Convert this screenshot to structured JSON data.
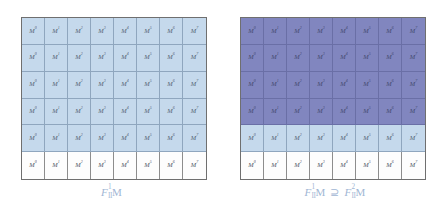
{
  "figure": {
    "colors": {
      "white_cell": "#fdfdfd",
      "light_blue_cell": "#c5d9ec",
      "dark_blue_cell": "#8186bf",
      "outer_border": "#6f6f6f",
      "inner_gridline": "#7b8ca3",
      "caption_text": "#9fb6d4",
      "cell_label_text": "#34404f"
    },
    "grid_size": {
      "columns": 8,
      "rows": 6
    }
  },
  "panels": [
    {
      "id": "left",
      "caption": {
        "f_letter": "F",
        "superscript": "1",
        "subscript": "II",
        "module_letter": "M",
        "relation": "",
        "second_f_letter": "",
        "second_superscript": "",
        "second_subscript": "",
        "second_module_letter": "",
        "full_text": "F¹₁₁M"
      },
      "row_tones": [
        "light",
        "light",
        "light",
        "light",
        "light",
        "white"
      ],
      "rows": [
        {
          "tone": "light",
          "cells": [
            {
              "base": "M",
              "sup": "0"
            },
            {
              "base": "M",
              "sup": "1"
            },
            {
              "base": "M",
              "sup": "2"
            },
            {
              "base": "M",
              "sup": "3"
            },
            {
              "base": "M",
              "sup": "4"
            },
            {
              "base": "M",
              "sup": "5"
            },
            {
              "base": "M",
              "sup": "6"
            },
            {
              "base": "M",
              "sup": "7"
            }
          ]
        },
        {
          "tone": "light",
          "cells": [
            {
              "base": "M",
              "sup": "0"
            },
            {
              "base": "M",
              "sup": "1"
            },
            {
              "base": "M",
              "sup": "2"
            },
            {
              "base": "M",
              "sup": "3"
            },
            {
              "base": "M",
              "sup": "4"
            },
            {
              "base": "M",
              "sup": "5"
            },
            {
              "base": "M",
              "sup": "6"
            },
            {
              "base": "M",
              "sup": "7"
            }
          ]
        },
        {
          "tone": "light",
          "cells": [
            {
              "base": "M",
              "sup": "0"
            },
            {
              "base": "M",
              "sup": "1"
            },
            {
              "base": "M",
              "sup": "2"
            },
            {
              "base": "M",
              "sup": "3"
            },
            {
              "base": "M",
              "sup": "4"
            },
            {
              "base": "M",
              "sup": "5"
            },
            {
              "base": "M",
              "sup": "6"
            },
            {
              "base": "M",
              "sup": "7"
            }
          ]
        },
        {
          "tone": "light",
          "cells": [
            {
              "base": "M",
              "sup": "0"
            },
            {
              "base": "M",
              "sup": "1"
            },
            {
              "base": "M",
              "sup": "2"
            },
            {
              "base": "M",
              "sup": "3"
            },
            {
              "base": "M",
              "sup": "4"
            },
            {
              "base": "M",
              "sup": "5"
            },
            {
              "base": "M",
              "sup": "6"
            },
            {
              "base": "M",
              "sup": "7"
            }
          ]
        },
        {
          "tone": "light",
          "cells": [
            {
              "base": "M",
              "sup": "0"
            },
            {
              "base": "M",
              "sup": "1"
            },
            {
              "base": "M",
              "sup": "2"
            },
            {
              "base": "M",
              "sup": "3"
            },
            {
              "base": "M",
              "sup": "4"
            },
            {
              "base": "M",
              "sup": "5"
            },
            {
              "base": "M",
              "sup": "6"
            },
            {
              "base": "M",
              "sup": "7"
            }
          ]
        },
        {
          "tone": "white",
          "cells": [
            {
              "base": "M",
              "sup": "0"
            },
            {
              "base": "M",
              "sup": "1"
            },
            {
              "base": "M",
              "sup": "2"
            },
            {
              "base": "M",
              "sup": "3"
            },
            {
              "base": "M",
              "sup": "4"
            },
            {
              "base": "M",
              "sup": "5"
            },
            {
              "base": "M",
              "sup": "6"
            },
            {
              "base": "M",
              "sup": "7"
            }
          ]
        }
      ]
    },
    {
      "id": "right",
      "caption": {
        "f_letter": "F",
        "superscript": "1",
        "subscript": "II",
        "module_letter": "M",
        "relation": "⊇",
        "second_f_letter": "F",
        "second_superscript": "2",
        "second_subscript": "II",
        "second_module_letter": "M",
        "full_text": "F¹₁₁M ⊇ F²₁₁M"
      },
      "row_tones": [
        "dark",
        "dark",
        "dark",
        "dark",
        "light",
        "white"
      ],
      "rows": [
        {
          "tone": "dark",
          "cells": [
            {
              "base": "M",
              "sup": "0"
            },
            {
              "base": "M",
              "sup": "1"
            },
            {
              "base": "M",
              "sup": "2"
            },
            {
              "base": "M",
              "sup": "3"
            },
            {
              "base": "M",
              "sup": "4"
            },
            {
              "base": "M",
              "sup": "5"
            },
            {
              "base": "M",
              "sup": "6"
            },
            {
              "base": "M",
              "sup": "7"
            }
          ]
        },
        {
          "tone": "dark",
          "cells": [
            {
              "base": "M",
              "sup": "0"
            },
            {
              "base": "M",
              "sup": "1"
            },
            {
              "base": "M",
              "sup": "2"
            },
            {
              "base": "M",
              "sup": "3"
            },
            {
              "base": "M",
              "sup": "4"
            },
            {
              "base": "M",
              "sup": "5"
            },
            {
              "base": "M",
              "sup": "6"
            },
            {
              "base": "M",
              "sup": "7"
            }
          ]
        },
        {
          "tone": "dark",
          "cells": [
            {
              "base": "M",
              "sup": "0"
            },
            {
              "base": "M",
              "sup": "1"
            },
            {
              "base": "M",
              "sup": "2"
            },
            {
              "base": "M",
              "sup": "3"
            },
            {
              "base": "M",
              "sup": "4"
            },
            {
              "base": "M",
              "sup": "5"
            },
            {
              "base": "M",
              "sup": "6"
            },
            {
              "base": "M",
              "sup": "7"
            }
          ]
        },
        {
          "tone": "dark",
          "cells": [
            {
              "base": "M",
              "sup": "0"
            },
            {
              "base": "M",
              "sup": "1"
            },
            {
              "base": "M",
              "sup": "2"
            },
            {
              "base": "M",
              "sup": "3"
            },
            {
              "base": "M",
              "sup": "4"
            },
            {
              "base": "M",
              "sup": "5"
            },
            {
              "base": "M",
              "sup": "6"
            },
            {
              "base": "M",
              "sup": "7"
            }
          ]
        },
        {
          "tone": "light",
          "cells": [
            {
              "base": "M",
              "sup": "0"
            },
            {
              "base": "M",
              "sup": "1"
            },
            {
              "base": "M",
              "sup": "2"
            },
            {
              "base": "M",
              "sup": "3"
            },
            {
              "base": "M",
              "sup": "4"
            },
            {
              "base": "M",
              "sup": "5"
            },
            {
              "base": "M",
              "sup": "6"
            },
            {
              "base": "M",
              "sup": "7"
            }
          ]
        },
        {
          "tone": "white",
          "cells": [
            {
              "base": "M",
              "sup": "0"
            },
            {
              "base": "M",
              "sup": "1"
            },
            {
              "base": "M",
              "sup": "2"
            },
            {
              "base": "M",
              "sup": "3"
            },
            {
              "base": "M",
              "sup": "4"
            },
            {
              "base": "M",
              "sup": "5"
            },
            {
              "base": "M",
              "sup": "6"
            },
            {
              "base": "M",
              "sup": "7"
            }
          ]
        }
      ]
    }
  ]
}
